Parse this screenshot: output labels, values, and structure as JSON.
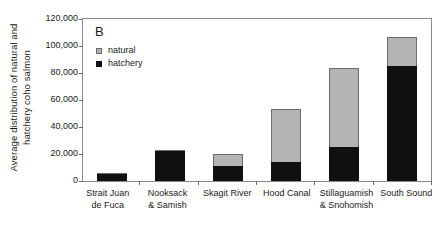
{
  "figure": {
    "panel_letter": "B",
    "y_axis_title_line1": "Average distribution of natural and",
    "y_axis_title_line2": "hatchery coho salmon"
  },
  "legend": {
    "position": "inside-top-left",
    "entries": [
      {
        "label": "natural",
        "color": "#b3b3b3",
        "marker": "square-outlined"
      },
      {
        "label": "hatchery",
        "color": "#101010",
        "marker": "square-filled"
      }
    ]
  },
  "chart_data": {
    "type": "bar",
    "stacked": true,
    "title": "B",
    "xlabel": "",
    "ylabel": "Average distribution of natural and hatchery coho salmon",
    "ylim": [
      0,
      120000
    ],
    "ytick_labels": [
      "120,000",
      "100,000",
      "80,000",
      "60,000",
      "40,000",
      "20,000",
      "0"
    ],
    "ytick_values": [
      120000,
      100000,
      80000,
      60000,
      40000,
      20000,
      0
    ],
    "grid": false,
    "legend_position": "upper left (inside plot)",
    "categories": [
      "Strait Juan de Fuca",
      "Nooksack & Samish",
      "Skagit River",
      "Hood Canal",
      "Stillaguamish & Snohomish",
      "South Sound"
    ],
    "category_label_lines": [
      [
        "Strait Juan",
        "de Fuca"
      ],
      [
        "Nooksack",
        "& Samish"
      ],
      [
        "Skagit River",
        ""
      ],
      [
        "Hood Canal",
        ""
      ],
      [
        "Stillaguamish",
        "& Snohomish"
      ],
      [
        "South Sound",
        ""
      ]
    ],
    "series": [
      {
        "name": "hatchery",
        "color": "#101010",
        "values": [
          5000,
          22000,
          11000,
          14000,
          25000,
          85000
        ]
      },
      {
        "name": "natural",
        "color": "#b3b3b3",
        "values": [
          1000,
          1000,
          9000,
          39000,
          59000,
          22000
        ]
      }
    ],
    "totals": [
      6000,
      23000,
      20000,
      53000,
      84000,
      107000
    ]
  }
}
